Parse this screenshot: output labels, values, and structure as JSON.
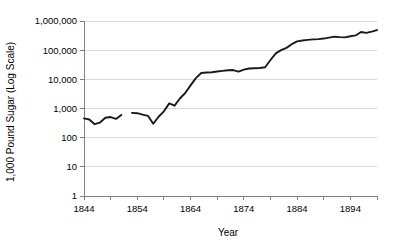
{
  "chart_data": {
    "type": "line",
    "title": "",
    "xlabel": "Year",
    "ylabel": "1,000 Pound Sugar (Log Scale)",
    "yscale": "log",
    "ylim": [
      1,
      1000000
    ],
    "xlim": [
      1844,
      1899
    ],
    "grid": true,
    "legend": null,
    "y_tick_labels": [
      "1,000,000",
      "100,000",
      "10,000",
      "1,000",
      "100",
      "10",
      "1"
    ],
    "y_tick_values": [
      1000000,
      100000,
      10000,
      1000,
      100,
      10,
      1
    ],
    "x_tick_labels": [
      "1844",
      "1854",
      "1864",
      "1874",
      "1884",
      "1894"
    ],
    "x_tick_values": [
      1844,
      1854,
      1864,
      1874,
      1884,
      1894
    ],
    "x_minor_ticks": [
      1844,
      1849,
      1854,
      1859,
      1864,
      1869,
      1874,
      1879,
      1884,
      1889,
      1894,
      1899
    ],
    "series": [
      {
        "name": "1,000 Pound Sugar",
        "x": [
          1844,
          1845,
          1846,
          1847,
          1848,
          1849,
          1850,
          1851,
          1852,
          1853,
          1854,
          1855,
          1856,
          1857,
          1858,
          1859,
          1860,
          1861,
          1862,
          1863,
          1864,
          1865,
          1866,
          1867,
          1868,
          1869,
          1870,
          1871,
          1872,
          1873,
          1874,
          1875,
          1876,
          1877,
          1878,
          1879,
          1880,
          1881,
          1882,
          1883,
          1884,
          1885,
          1886,
          1887,
          1888,
          1889,
          1890,
          1891,
          1892,
          1893,
          1894,
          1895,
          1896,
          1897,
          1898,
          1899
        ],
        "y": [
          460,
          420,
          290,
          330,
          480,
          510,
          440,
          600,
          690,
          710,
          690,
          620,
          560,
          300,
          520,
          800,
          1500,
          1250,
          2200,
          3400,
          6200,
          11000,
          16500,
          17200,
          17500,
          18500,
          19500,
          20500,
          20800,
          18400,
          21500,
          23500,
          24000,
          24500,
          26000,
          46000,
          78000,
          100000,
          120000,
          160000,
          200000,
          215000,
          225000,
          235000,
          240000,
          250000,
          270000,
          290000,
          280000,
          275000,
          300000,
          320000,
          420000,
          390000,
          430000,
          490000
        ]
      }
    ],
    "gap": {
      "start_year": 1851.6,
      "end_year": 1853.0
    }
  },
  "axes": {
    "y_axis_title": "1,000 Pound Sugar (Log Scale)",
    "x_axis_title": "Year"
  },
  "colors": {
    "line": "#1a1a1a",
    "grid": "#d9d9d9",
    "axis": "#808080",
    "background": "#ffffff"
  }
}
